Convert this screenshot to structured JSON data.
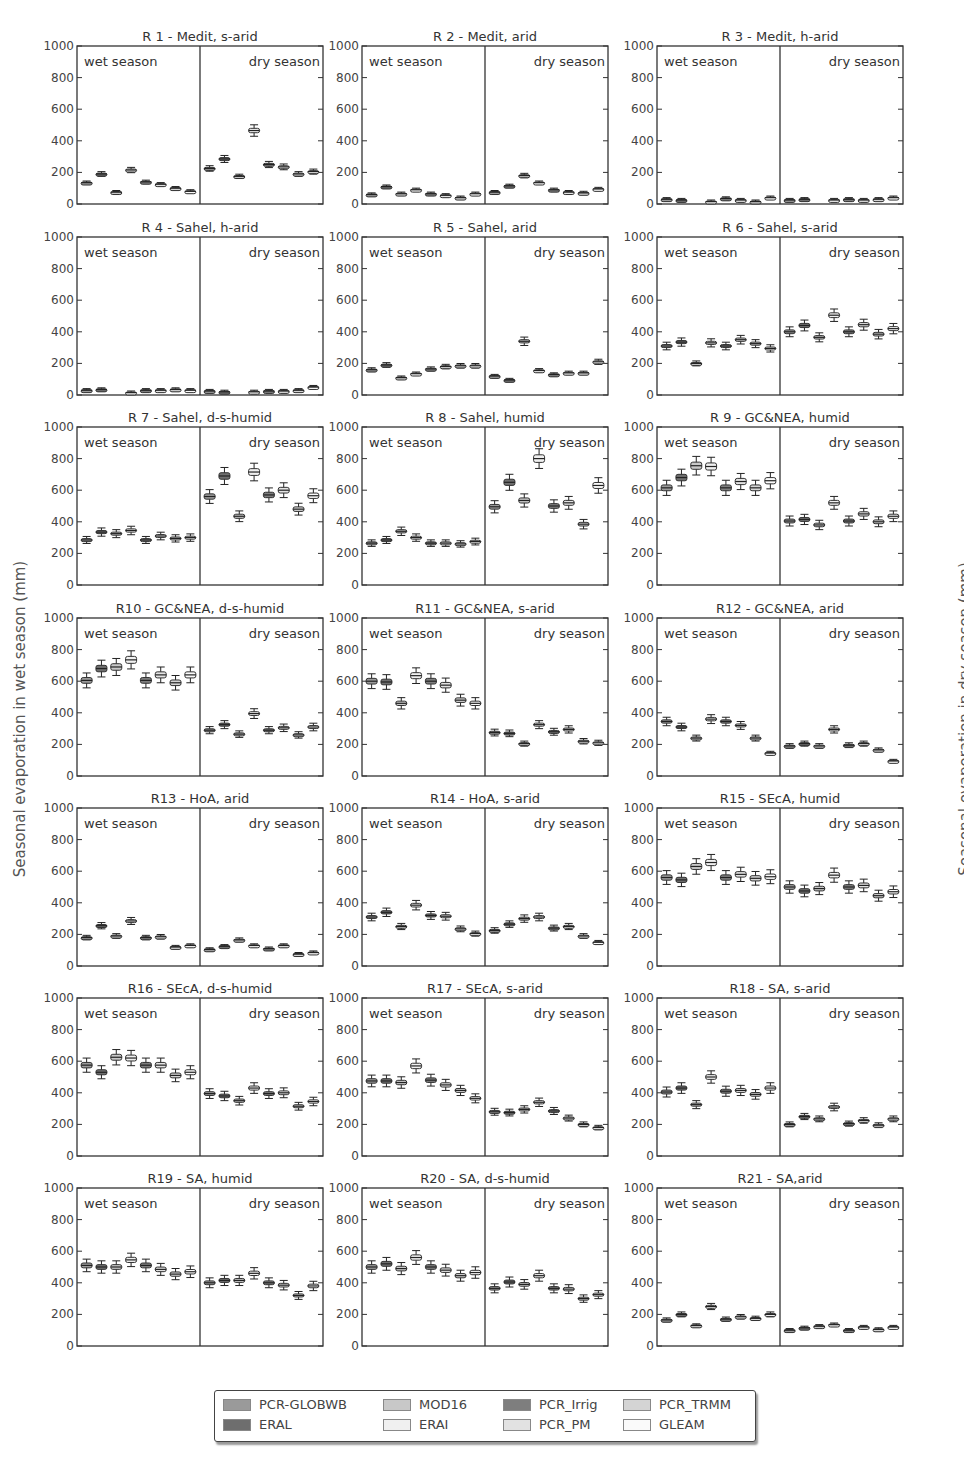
{
  "figure": {
    "ylabel_left": "Seasonal evaporation in wet season (mm)",
    "ylabel_right": "Seasonal evaporation in dry season (mm)",
    "wet_label": "wet season",
    "dry_label": "dry season",
    "yticks": [
      0,
      200,
      400,
      600,
      800,
      1000
    ]
  },
  "legend": {
    "items": [
      {
        "label": "PCR-GLOBWB",
        "color": "#9a9a9a"
      },
      {
        "label": "MOD16",
        "color": "#c8c8c8"
      },
      {
        "label": "PCR_Irrig",
        "color": "#7e7e7e"
      },
      {
        "label": "PCR_TRMM",
        "color": "#d4d4d4"
      },
      {
        "label": "ERAL",
        "color": "#6e6e6e"
      },
      {
        "label": "ERAI",
        "color": "#f0f0f0"
      },
      {
        "label": "PCR_PM",
        "color": "#e2e2e2"
      },
      {
        "label": "GLEAM",
        "color": "#fafafa"
      }
    ]
  },
  "chart_data": {
    "type": "boxplot",
    "title": "",
    "ylabel_left": "Seasonal evaporation in wet season (mm)",
    "ylabel_right": "Seasonal evaporation in dry season (mm)",
    "ylim": [
      0,
      1000
    ],
    "grid": false,
    "legend_position": "bottom",
    "series_order": [
      "PCR-GLOBWB",
      "ERAL",
      "MOD16",
      "ERAI",
      "PCR_Irrig",
      "PCR_PM",
      "PCR_TRMM",
      "GLEAM"
    ],
    "note": "values are approximate medians per product (mm) read from box plots; wet = left half, dry = right half",
    "panels": [
      {
        "title": "R 1 - Medit, s-arid",
        "wet": [
          135,
          190,
          75,
          215,
          140,
          125,
          100,
          80
        ],
        "dry": [
          225,
          285,
          175,
          465,
          250,
          235,
          190,
          205
        ]
      },
      {
        "title": "R 2 - Medit, arid",
        "wet": [
          60,
          110,
          65,
          90,
          65,
          55,
          40,
          65
        ],
        "dry": [
          75,
          115,
          180,
          135,
          90,
          75,
          70,
          95
        ]
      },
      {
        "title": "R 3 - Medit, h-arid",
        "wet": [
          30,
          25,
          0,
          15,
          35,
          25,
          15,
          40
        ],
        "dry": [
          25,
          30,
          0,
          25,
          30,
          25,
          30,
          40
        ]
      },
      {
        "title": "R 4 - Sahel, h-arid",
        "wet": [
          30,
          35,
          0,
          15,
          30,
          30,
          35,
          30
        ],
        "dry": [
          25,
          20,
          0,
          20,
          25,
          25,
          30,
          50
        ]
      },
      {
        "title": "R 5 - Sahel, arid",
        "wet": [
          160,
          190,
          110,
          135,
          165,
          180,
          185,
          185
        ],
        "dry": [
          120,
          95,
          340,
          155,
          130,
          140,
          140,
          210
        ]
      },
      {
        "title": "R 6 - Sahel, s-arid",
        "wet": [
          310,
          335,
          200,
          330,
          310,
          350,
          325,
          295
        ],
        "dry": [
          400,
          440,
          365,
          505,
          400,
          445,
          385,
          420
        ]
      },
      {
        "title": "R 7 - Sahel, d-s-humid",
        "wet": [
          285,
          335,
          325,
          345,
          285,
          310,
          295,
          300
        ],
        "dry": [
          560,
          690,
          435,
          715,
          570,
          600,
          480,
          565
        ]
      },
      {
        "title": "R 8 - Sahel, humid",
        "wet": [
          265,
          285,
          340,
          300,
          265,
          265,
          260,
          275
        ],
        "dry": [
          495,
          650,
          535,
          800,
          500,
          520,
          385,
          630
        ]
      },
      {
        "title": "R 9 - GC&NEA, humid",
        "wet": [
          615,
          680,
          755,
          750,
          615,
          655,
          615,
          660
        ],
        "dry": [
          405,
          415,
          380,
          520,
          405,
          450,
          400,
          435
        ]
      },
      {
        "title": "R10 - GC&NEA, d-s-humid",
        "wet": [
          605,
          680,
          690,
          735,
          605,
          640,
          590,
          640
        ],
        "dry": [
          290,
          325,
          265,
          395,
          290,
          305,
          260,
          310
        ]
      },
      {
        "title": "R11 - GC&NEA, s-arid",
        "wet": [
          600,
          595,
          460,
          635,
          600,
          575,
          480,
          460
        ],
        "dry": [
          275,
          270,
          205,
          325,
          280,
          295,
          220,
          210
        ]
      },
      {
        "title": "R12 - GC&NEA, arid",
        "wet": [
          345,
          310,
          240,
          360,
          345,
          320,
          240,
          145
        ],
        "dry": [
          190,
          205,
          190,
          295,
          195,
          205,
          165,
          95
        ]
      },
      {
        "title": "R13 - HoA, arid",
        "wet": [
          180,
          255,
          190,
          285,
          180,
          185,
          120,
          130
        ],
        "dry": [
          105,
          125,
          165,
          130,
          110,
          130,
          75,
          85
        ]
      },
      {
        "title": "R14 - HoA, s-arid",
        "wet": [
          310,
          340,
          250,
          385,
          320,
          315,
          235,
          205
        ],
        "dry": [
          225,
          265,
          300,
          310,
          240,
          250,
          190,
          150
        ]
      },
      {
        "title": "R15 - SEcA, humid",
        "wet": [
          560,
          545,
          630,
          655,
          560,
          580,
          555,
          565
        ],
        "dry": [
          500,
          475,
          490,
          575,
          500,
          510,
          445,
          470
        ]
      },
      {
        "title": "R16 - SEcA, d-s-humid",
        "wet": [
          575,
          530,
          625,
          620,
          575,
          575,
          510,
          530
        ],
        "dry": [
          395,
          380,
          350,
          430,
          395,
          400,
          315,
          345
        ]
      },
      {
        "title": "R17 - SEcA, s-arid",
        "wet": [
          475,
          475,
          465,
          570,
          480,
          450,
          415,
          365
        ],
        "dry": [
          280,
          275,
          295,
          340,
          285,
          240,
          200,
          180
        ]
      },
      {
        "title": "R18 - SA, s-arid",
        "wet": [
          405,
          430,
          325,
          500,
          410,
          415,
          390,
          430
        ],
        "dry": [
          200,
          250,
          235,
          310,
          205,
          225,
          195,
          235
        ]
      },
      {
        "title": "R19 - SA, humid",
        "wet": [
          510,
          500,
          500,
          545,
          510,
          485,
          455,
          470
        ],
        "dry": [
          400,
          415,
          415,
          460,
          400,
          385,
          320,
          380
        ]
      },
      {
        "title": "R20 - SA, d-s-humid",
        "wet": [
          500,
          520,
          490,
          560,
          500,
          480,
          445,
          465
        ],
        "dry": [
          365,
          405,
          390,
          445,
          365,
          360,
          300,
          325
        ]
      },
      {
        "title": "R21 - SA,arid",
        "wet": [
          165,
          200,
          130,
          250,
          170,
          185,
          175,
          200
        ],
        "dry": [
          100,
          115,
          125,
          135,
          100,
          120,
          105,
          120
        ]
      }
    ]
  }
}
